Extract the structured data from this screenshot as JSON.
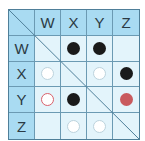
{
  "matrix": {
    "columns": [
      "W",
      "X",
      "Y",
      "Z"
    ],
    "rows": [
      {
        "label": "W",
        "cells": [
          "",
          "black",
          "black",
          ""
        ]
      },
      {
        "label": "X",
        "cells": [
          "white",
          "",
          "white",
          "black"
        ]
      },
      {
        "label": "Y",
        "cells": [
          "red-ring",
          "black",
          "",
          "red-fill"
        ]
      },
      {
        "label": "Z",
        "cells": [
          "",
          "white",
          "white",
          ""
        ]
      }
    ],
    "colors": {
      "header_bg": "#a9dbf2",
      "cell_bg": "#e3f4fb",
      "grid_line": "#6b9ab3",
      "black_dot": "#1a1a1a",
      "red_ring": "#d9606b",
      "red_fill": "#c95a5e"
    }
  }
}
